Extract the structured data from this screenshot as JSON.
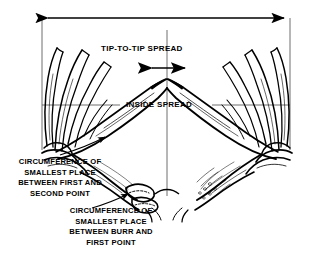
{
  "figure": {
    "name": "deer-antler-measurement-diagram",
    "background_color": "#ffffff",
    "ink_color": "#000000",
    "guide_color": "#5a5a5a",
    "width": 311,
    "height": 262
  },
  "labels": {
    "tip_to_tip_spread": "TIP-TO-TIP SPREAD",
    "inside_spread": "INSIDE SPREAD",
    "circumference_first_second": "CIRCUMFERENCE OF SMALLEST PLACE BETWEEN FIRST AND SECOND POINT",
    "circumference_burr_first": "CIRCUMFERENCE OF SMALLEST PLACE BETWEEN BURR AND FIRST POINT"
  },
  "label_lines": {
    "circ_first_second": [
      "CIRCUMFERENCE OF",
      "SMALLEST PLACE",
      "BETWEEN FIRST AND",
      "SECOND POINT"
    ],
    "circ_burr_first": [
      "CIRCUMFERENCE OF",
      "SMALLEST PLACE",
      "BETWEEN BURR AND",
      "FIRST POINT"
    ]
  },
  "measurements": [
    {
      "id": "greatest-spread",
      "label": "",
      "arrow": "double",
      "orientation": "horizontal",
      "y": 18,
      "x_start": 42,
      "x_end": 290
    },
    {
      "id": "tip-to-tip-spread",
      "label": "TIP-TO-TIP SPREAD",
      "arrow": "double",
      "orientation": "horizontal",
      "y": 68,
      "x_start": 147,
      "x_end": 190
    },
    {
      "id": "inside-spread",
      "label": "INSIDE SPREAD",
      "arrow": "none",
      "orientation": "horizontal",
      "y": 105,
      "x_start": 42,
      "x_end": 290
    }
  ],
  "icons": {
    "left_arrowhead": "arrow-left-icon",
    "right_arrowhead": "arrow-right-icon",
    "leader_arrow": "leader-arrow-icon"
  }
}
